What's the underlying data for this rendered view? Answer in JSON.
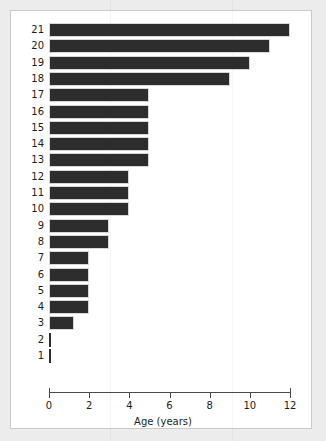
{
  "chart_data": {
    "type": "bar",
    "orientation": "horizontal",
    "title": "",
    "subtitle": "",
    "xlabel": "Age (years)",
    "ylabel": "",
    "xlim": [
      0,
      12
    ],
    "ylim_categories": [
      1,
      21
    ],
    "xticks": [
      0,
      2,
      4,
      6,
      8,
      10,
      12
    ],
    "xtick_labels": [
      "0",
      "2",
      "4",
      "6",
      "8",
      "10",
      "12"
    ],
    "ytick_labels": [
      "21",
      "20",
      "19",
      "18",
      "17",
      "16",
      "15",
      "14",
      "13",
      "12",
      "11",
      "10",
      "9",
      "8",
      "7",
      "6",
      "5",
      "4",
      "3",
      "2",
      "1"
    ],
    "grid": false,
    "legend": null,
    "bar_color": "#2d2d2d",
    "bar_edge_color": "#d7d7d7",
    "background_color": "#ffffff",
    "figure_color": "#ececed",
    "categories": [
      "21",
      "20",
      "19",
      "18",
      "17",
      "16",
      "15",
      "14",
      "13",
      "12",
      "11",
      "10",
      "9",
      "8",
      "7",
      "6",
      "5",
      "4",
      "3",
      "2",
      "1"
    ],
    "values": [
      12,
      11,
      10,
      9,
      5,
      5,
      5,
      5,
      5,
      4,
      4,
      4,
      3,
      3,
      2,
      2,
      2,
      2,
      1.25,
      0.08,
      0.08
    ],
    "bars": [
      {
        "category": "21",
        "value": 12
      },
      {
        "category": "20",
        "value": 11
      },
      {
        "category": "19",
        "value": 10
      },
      {
        "category": "18",
        "value": 9
      },
      {
        "category": "17",
        "value": 5
      },
      {
        "category": "16",
        "value": 5
      },
      {
        "category": "15",
        "value": 5
      },
      {
        "category": "14",
        "value": 5
      },
      {
        "category": "13",
        "value": 5
      },
      {
        "category": "12",
        "value": 4
      },
      {
        "category": "11",
        "value": 4
      },
      {
        "category": "10",
        "value": 4
      },
      {
        "category": "9",
        "value": 3
      },
      {
        "category": "8",
        "value": 3
      },
      {
        "category": "7",
        "value": 2
      },
      {
        "category": "6",
        "value": 2
      },
      {
        "category": "5",
        "value": 2
      },
      {
        "category": "4",
        "value": 2
      },
      {
        "category": "3",
        "value": 1.25
      },
      {
        "category": "2",
        "value": 0.08
      },
      {
        "category": "1",
        "value": 0.08
      }
    ]
  }
}
